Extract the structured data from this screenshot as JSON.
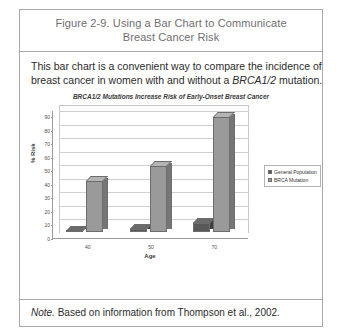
{
  "figure": {
    "title_line1": "Figure 2-9. Using a Bar Chart to Communicate",
    "title_line2": "Breast Cancer Risk",
    "caption_line1": "This bar chart is a convenient way to compare the incidence of",
    "caption_line2_before": "breast cancer in women with and without a ",
    "caption_line2_italic": "BRCA1/2",
    "caption_line2_after": " mutation.",
    "note_lead": "Note.",
    "note_body": " Based on information from Thompson et al., 2002."
  },
  "colors": {
    "general_population": "#585858",
    "general_population_side": "#3f3f3f",
    "general_population_top": "#6b6b6b",
    "brca_mutation": "#9a9a9a",
    "brca_mutation_side": "#767676",
    "brca_mutation_top": "#b4b4b4",
    "frame": "#a8a8a8",
    "gridline": "#cfcfcf",
    "axis": "#9a9a9a",
    "title_text": "#6f6f6f",
    "body_text": "#2b2b2b"
  },
  "chart_data": {
    "type": "bar",
    "title": "BRCA1/2 Mutations Increase Risk of Early-Onset Breast Cancer",
    "xlabel": "Age",
    "ylabel": "% Risk",
    "categories": [
      "40",
      "50",
      "70"
    ],
    "yticks": [
      "0",
      "10",
      "20",
      "30",
      "40",
      "50",
      "60",
      "70",
      "80",
      "90"
    ],
    "ylim": [
      0,
      90
    ],
    "grid": true,
    "legend_position": "right",
    "style": "3d-clustered-column",
    "series": [
      {
        "name": "General Population",
        "values": [
          1,
          2,
          7
        ]
      },
      {
        "name": "BRCA Mutation",
        "values": [
          38,
          49,
          85
        ]
      }
    ]
  }
}
